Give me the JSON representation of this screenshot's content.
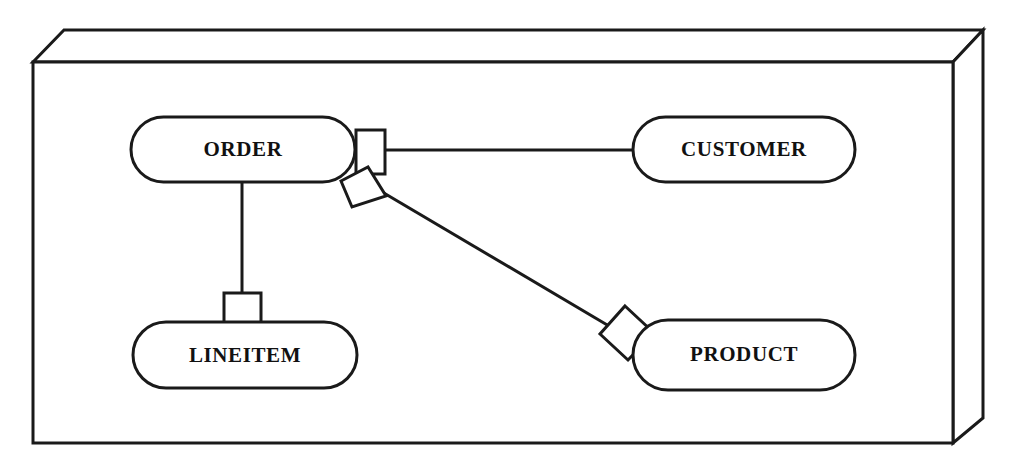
{
  "diagram": {
    "style": {
      "stroke_color": "#1a1a1a",
      "fill_color": "#ffffff",
      "background_color": "#ffffff",
      "entity_stroke_width": 3,
      "connector_stroke_width": 3,
      "frame_stroke_width": 3
    },
    "frame": {
      "name": "3d-box-frame",
      "front_face": {
        "x": 33,
        "y": 62,
        "width": 920,
        "height": 381
      },
      "depth_offset_x": 30,
      "depth_offset_y": -32,
      "top_face_points": "33,62 64,30 983,30 953,62",
      "right_face_points": "953,62 983,30 983,418 953,443"
    },
    "entities": [
      {
        "id": "order",
        "label": "ORDER",
        "x": 131,
        "y": 117,
        "width": 224,
        "height": 65,
        "font_size": 21
      },
      {
        "id": "customer",
        "label": "CUSTOMER",
        "x": 633,
        "y": 117,
        "width": 222,
        "height": 65,
        "font_size": 21
      },
      {
        "id": "lineitem",
        "label": "LINEITEM",
        "x": 133,
        "y": 322,
        "width": 224,
        "height": 66,
        "font_size": 21
      },
      {
        "id": "product",
        "label": "PRODUCT",
        "x": 633,
        "y": 320,
        "width": 222,
        "height": 70,
        "font_size": 21
      }
    ],
    "relationships": [
      {
        "id": "order-customer",
        "from": "order",
        "to": "customer",
        "line": {
          "x1": 355,
          "y1": 150,
          "x2": 634,
          "y2": 150
        },
        "connector": {
          "type": "square",
          "shape_name": "order-customer-square-connector",
          "points": "356,130 385,130 385,174 356,174"
        }
      },
      {
        "id": "order-product",
        "from": "order",
        "to": "product",
        "line": {
          "x1": 372,
          "y1": 186,
          "x2": 614,
          "y2": 329
        },
        "connector_near_order": {
          "type": "kite",
          "shape_name": "order-product-kite-connector",
          "points": "341,181 368,167 386,196 352,207"
        },
        "connector_near_product": {
          "type": "diamond",
          "shape_name": "order-product-diamond-connector",
          "points": "625,306 654,333 628,360 600,334"
        }
      },
      {
        "id": "order-lineitem",
        "from": "order",
        "to": "lineitem",
        "line": {
          "x1": 242,
          "y1": 182,
          "x2": 242,
          "y2": 296
        },
        "connector": {
          "type": "square",
          "shape_name": "order-lineitem-square-connector",
          "points": "224,293 261,293 261,324 224,324"
        }
      }
    ]
  }
}
